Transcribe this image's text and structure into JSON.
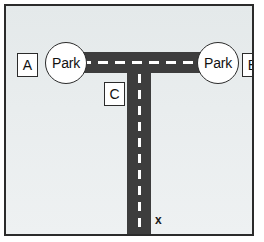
{
  "diagram": {
    "background_color": "#e7ebec",
    "border_color": "#2b2b2b",
    "road_color": "#3d3d3d",
    "centerline_color": "#ffffff",
    "nodes": [
      {
        "id": "park-left",
        "label": "Park",
        "shape": "circle"
      },
      {
        "id": "park-right",
        "label": "Park",
        "shape": "circle"
      }
    ],
    "labels": [
      {
        "id": "label-a",
        "text": "A",
        "shape": "square"
      },
      {
        "id": "label-b",
        "text": "B",
        "shape": "square"
      },
      {
        "id": "label-c",
        "text": "C",
        "shape": "square"
      }
    ],
    "markers": [
      {
        "id": "marker-x",
        "text": "x"
      }
    ],
    "roads": [
      {
        "id": "road-horizontal",
        "orientation": "horizontal",
        "centerline": "dashed"
      },
      {
        "id": "road-vertical",
        "orientation": "vertical",
        "centerline": "dashed"
      }
    ]
  }
}
